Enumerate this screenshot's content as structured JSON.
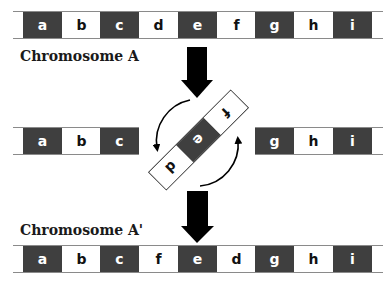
{
  "diagram": {
    "type": "chromosomal-inversion",
    "colors": {
      "dark_segment": "#3f3f3f",
      "light_segment": "#ffffff",
      "arrow": "#000000",
      "line": "#8a8a8a"
    },
    "chromosome_a": {
      "label": "Chromosome A",
      "segments": [
        {
          "letter": "a",
          "shade": "dark"
        },
        {
          "letter": "b",
          "shade": "light"
        },
        {
          "letter": "c",
          "shade": "dark"
        },
        {
          "letter": "d",
          "shade": "light"
        },
        {
          "letter": "e",
          "shade": "dark"
        },
        {
          "letter": "f",
          "shade": "light"
        },
        {
          "letter": "g",
          "shade": "dark"
        },
        {
          "letter": "h",
          "shade": "light"
        },
        {
          "letter": "i",
          "shade": "dark"
        }
      ]
    },
    "break_stage": {
      "left_fragment": [
        {
          "letter": "a",
          "shade": "dark"
        },
        {
          "letter": "b",
          "shade": "light"
        },
        {
          "letter": "c",
          "shade": "dark"
        }
      ],
      "inverted_fragment": [
        {
          "letter": "d",
          "shade": "light"
        },
        {
          "letter": "e",
          "shade": "dark"
        },
        {
          "letter": "f",
          "shade": "light"
        }
      ],
      "right_fragment": [
        {
          "letter": "g",
          "shade": "dark"
        },
        {
          "letter": "h",
          "shade": "light"
        },
        {
          "letter": "i",
          "shade": "dark"
        }
      ],
      "rotation_arrows": [
        "curved-arrow-counterclockwise-left",
        "curved-arrow-counterclockwise-right"
      ]
    },
    "chromosome_a_prime": {
      "label": "Chromosome A'",
      "segments": [
        {
          "letter": "a",
          "shade": "dark"
        },
        {
          "letter": "b",
          "shade": "light"
        },
        {
          "letter": "c",
          "shade": "dark"
        },
        {
          "letter": "f",
          "shade": "light"
        },
        {
          "letter": "e",
          "shade": "dark"
        },
        {
          "letter": "d",
          "shade": "light"
        },
        {
          "letter": "g",
          "shade": "dark"
        },
        {
          "letter": "h",
          "shade": "light"
        },
        {
          "letter": "i",
          "shade": "dark"
        }
      ]
    }
  }
}
